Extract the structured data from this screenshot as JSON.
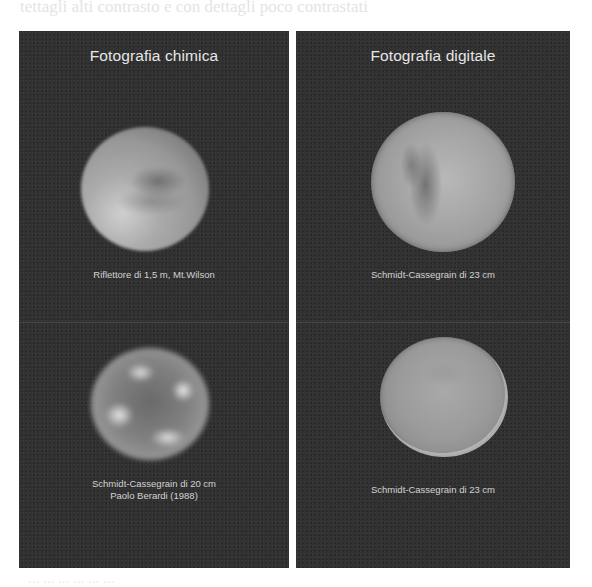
{
  "page": {
    "bleed_text_top": "tettagli alti contrasto e con dettagli poco contrastati",
    "bleed_text_bottom": "... ... ... ... ... ..."
  },
  "figure": {
    "columns": [
      {
        "title": "Fotografia chimica",
        "images": [
          {
            "caption_lines": [
              "Riflettore di  1,5 m, Mt.Wilson"
            ],
            "subject": "Mars"
          },
          {
            "caption_lines": [
              "Schmidt-Cassegrain di  20 cm",
              "Paolo Berardi (1988)"
            ],
            "subject": "Mars"
          }
        ]
      },
      {
        "title": "Fotografia digitale",
        "images": [
          {
            "caption_lines": [
              "Schmidt-Cassegrain di  23 cm"
            ],
            "subject": "Mars"
          },
          {
            "caption_lines": [
              "Schmidt-Cassegrain di  23 cm"
            ],
            "subject": "Mars"
          }
        ]
      }
    ],
    "colors": {
      "panel_background": "#323232",
      "title_text": "#e6e6e6",
      "caption_text": "#d2d2d2",
      "page_background": "#ffffff"
    }
  }
}
